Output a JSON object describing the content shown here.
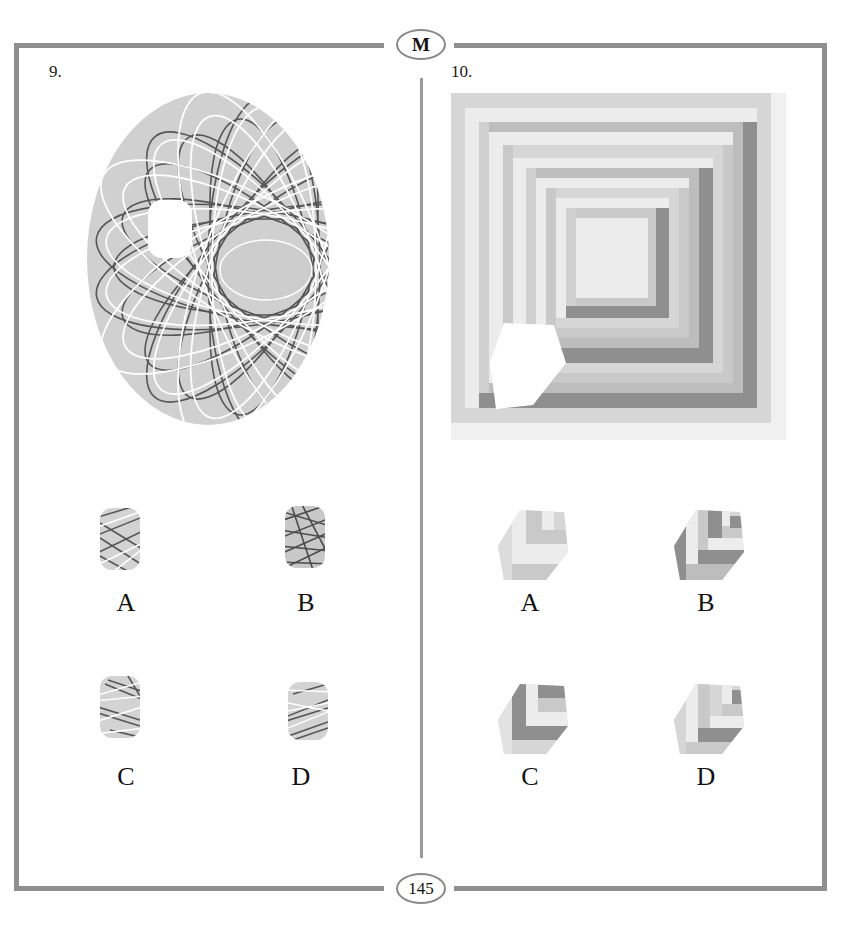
{
  "page": {
    "section_badge": "M",
    "page_number": "145"
  },
  "questions": [
    {
      "number": "9.",
      "figure": {
        "type": "ellipse-with-crossing-ellipse-lines",
        "fill_color": "#d0d0d0",
        "line_colors": [
          "#555555",
          "#ffffff"
        ],
        "missing_piece": "rounded-rectangle cutout on left side",
        "inner_ellipse_color": "#cdcdcd"
      },
      "options": [
        {
          "label": "A",
          "description": "light pattern with dark and white crossing lines"
        },
        {
          "label": "B",
          "description": "dense dark crossing lines"
        },
        {
          "label": "C",
          "description": "white and dark crossed lines, horizontal bands"
        },
        {
          "label": "D",
          "description": "white and dark crossed lines, diagonal"
        }
      ]
    },
    {
      "number": "10.",
      "figure": {
        "type": "nested-square-frames",
        "colors": [
          "#d6d6d6",
          "#ececec",
          "#bdbdbd",
          "#8f8f8f",
          "#c9c9c9"
        ],
        "missing_piece": "hexagon cutout at lower-left"
      },
      "options": [
        {
          "label": "A",
          "description": "light hexagon with L-shaped bands"
        },
        {
          "label": "B",
          "description": "hexagon with dark left face and dark bands"
        },
        {
          "label": "C",
          "description": "hexagon with dark L band"
        },
        {
          "label": "D",
          "description": "hexagon with light left face and dark lower band"
        }
      ]
    }
  ],
  "colors": {
    "frame": "#8f8f8f",
    "background": "#ffffff",
    "dark_band": "#8f8f8f",
    "mid_band": "#bdbdbd",
    "light_band": "#d6d6d6",
    "pale_band": "#ececec"
  }
}
